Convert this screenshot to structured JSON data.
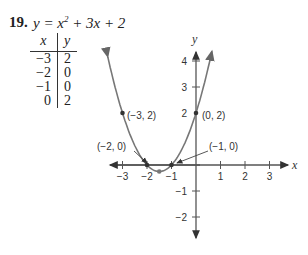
{
  "problem": {
    "number": "19.",
    "equation_lhs": "y = x",
    "equation_exp": "2",
    "equation_rhs": " + 3x + 2"
  },
  "table": {
    "headers": [
      "x",
      "y"
    ],
    "rows": [
      [
        "−3",
        "2"
      ],
      [
        "−2",
        "0"
      ],
      [
        "−1",
        "0"
      ],
      [
        "0",
        "2"
      ]
    ]
  },
  "colors": {
    "curve": "#777777",
    "axis": "#555555",
    "text": "#222222"
  },
  "chart_data": {
    "type": "line",
    "xlabel": "x",
    "ylabel": "y",
    "xlim": [
      -3.5,
      3.5
    ],
    "ylim": [
      -2.7,
      4.5
    ],
    "x_ticks": [
      -3,
      -2,
      -1,
      1,
      2,
      3
    ],
    "y_ticks": [
      -2,
      -1,
      3,
      4
    ],
    "x_tick_labels": [
      "−3",
      "−2",
      "−1",
      "1",
      "2",
      "3"
    ],
    "y_tick_labels": [
      "−2",
      "−1",
      "2",
      "3",
      "4"
    ],
    "series": [
      {
        "name": "y = x^2 + 3x + 2",
        "x": [
          -3.6,
          -3,
          -2,
          -1.5,
          -1,
          0,
          0.65
        ],
        "y": [
          4.56,
          2,
          0,
          -0.25,
          0,
          2,
          4.37
        ]
      }
    ],
    "points": [
      {
        "label": "(−3, 2)",
        "x": -3,
        "y": 2
      },
      {
        "label": "(−2, 0)",
        "x": -2,
        "y": 0
      },
      {
        "label": "(−1, 0)",
        "x": -1,
        "y": 0
      },
      {
        "label": "(0, 2)",
        "x": 0,
        "y": 2
      },
      {
        "label": "",
        "x": -1.5,
        "y": -0.25
      }
    ],
    "grid": false
  }
}
